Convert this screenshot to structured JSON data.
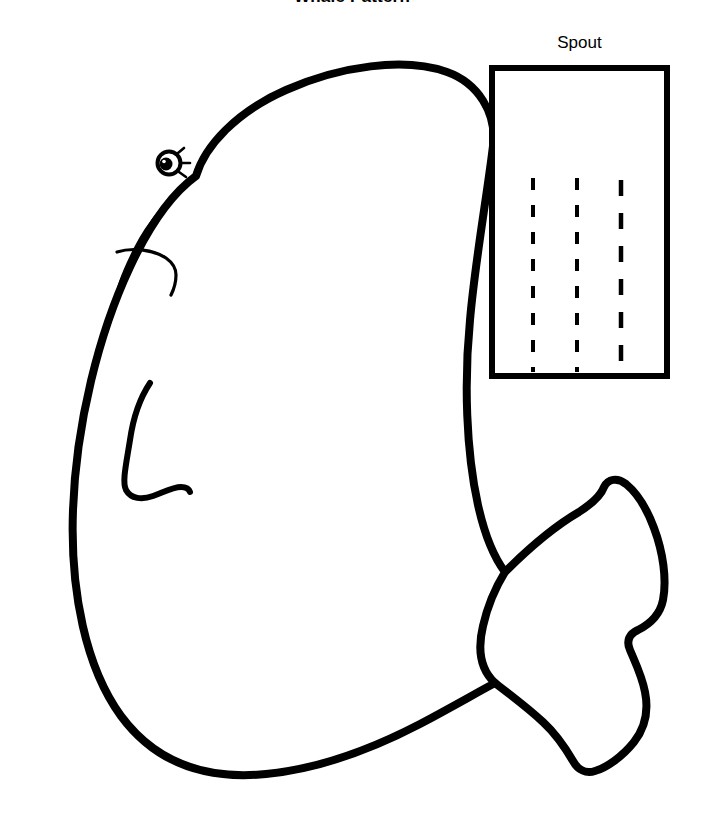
{
  "page": {
    "width": 704,
    "height": 814,
    "background_color": "#ffffff",
    "ink_color": "#000000",
    "title": "Whale Pattern",
    "title_clipped_at_top": true
  },
  "labels": {
    "spout": "Spout"
  },
  "artwork": {
    "whale": {
      "name": "whale-pattern-outline",
      "stroke_color": "#000000",
      "body_stroke_width": 8,
      "detail_stroke_width": 3,
      "description": "Large cartoon whale body outline facing left with a fluked tail at lower right",
      "body_path": "M 196 176 C 205 146 236 112 286 90 C 340 66 404 57 447 72 C 478 83 497 113 493 146 C 487 196 475 262 470 320 C 464 381 466 451 478 505 C 486 541 496 560 505 572 C 497 585 488 604 483 626 C 477 651 481 670 495 683 C 478 692 452 707 420 724 C 372 749 318 769 266 774 C 205 780 155 762 121 716 C 86 668 70 592 73 510 C 76 424 99 333 130 267 C 152 220 174 192 196 176 Z",
      "jaw_line_path": "M 196 176 C 180 189 152 215 135 249 C 122 275 116 292 117 300",
      "mouth_line_path": "M 118 253 C 133 249 153 251 165 258 C 172 262 175 268 175 273",
      "flipper_path": "M 147 384 C 139 401 133 421 130 441 C 126 466 123 483 126 491 C 130 499 141 500 152 496 C 163 492 172 487 181 487 C 186 487 188 489 189 491"
    },
    "spout_piece": {
      "name": "spout-rectangle-pattern",
      "rect": {
        "x": 489,
        "y": 65,
        "width": 181,
        "height": 314
      },
      "border_color": "#000000",
      "border_width": 6,
      "fill": "#ffffff",
      "dashed_lines": {
        "count": 3,
        "stroke_color": "#000000",
        "stroke_width": 4,
        "dash_pattern": "12 14",
        "x_positions": [
          533,
          577,
          621
        ],
        "y_start": 178,
        "y_end": 372
      }
    }
  }
}
